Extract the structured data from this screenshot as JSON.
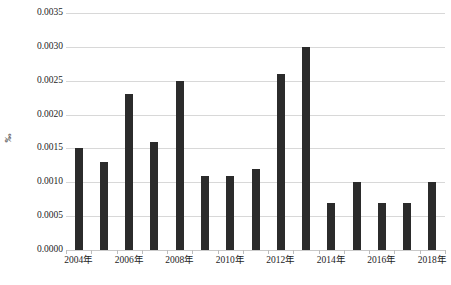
{
  "chart_data": {
    "type": "bar",
    "title": "",
    "xlabel": "",
    "ylabel": "‰",
    "categories": [
      "2004年",
      "2005年",
      "2006年",
      "2007年",
      "2008年",
      "2009年",
      "2010年",
      "2011年",
      "2012年",
      "2013年",
      "2014年",
      "2015年",
      "2016年",
      "2017年",
      "2018年"
    ],
    "values": [
      0.0015,
      0.0013,
      0.0023,
      0.0016,
      0.0025,
      0.0011,
      0.0011,
      0.0012,
      0.0026,
      0.003,
      0.0007,
      0.001,
      0.0007,
      0.0007,
      0.001
    ],
    "ylim": [
      0.0,
      0.0035
    ],
    "ytick_step": 0.0005,
    "ytick_labels": [
      "0.0000",
      "0.0005",
      "0.0010",
      "0.0015",
      "0.0020",
      "0.0025",
      "0.0030",
      "0.0035"
    ],
    "ytick_values": [
      0.0,
      0.0005,
      0.001,
      0.0015,
      0.002,
      0.0025,
      0.003,
      0.0035
    ],
    "xtick_labels_shown": [
      "2004年",
      "2006年",
      "2008年",
      "2010年",
      "2012年",
      "2014年",
      "2016年",
      "2018年"
    ],
    "xtick_label_indices": [
      0,
      2,
      4,
      6,
      8,
      10,
      12,
      14
    ],
    "grid": true,
    "grid_axis": "y",
    "legend": false,
    "legend_position": "none",
    "bar_color": "#2b2b2b",
    "grid_color": "#d8d8d8",
    "background_color": "#ffffff"
  },
  "caption": ""
}
